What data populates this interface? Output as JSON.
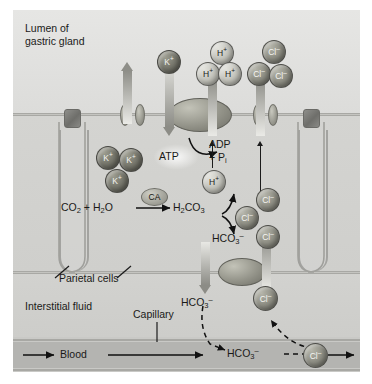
{
  "figure": {
    "background_color": "#d9d9d7"
  },
  "regions": {
    "lumen_label_line1": "Lumen of",
    "lumen_label_line2": "gastric gland",
    "parietal_label": "Parietal cells",
    "interstitial_label": "Interstitial fluid",
    "capillary_label": "Capillary",
    "blood_label": "Blood"
  },
  "reaction": {
    "enzyme": "CA",
    "substrates": "CO2 + H2O",
    "product": "H2CO3",
    "dissociation_products": [
      "H+",
      "HCO3-"
    ],
    "co2": "CO",
    "co2_sub": "2",
    "h2o_h": "H",
    "h2o_sub": "2",
    "h2o_o": "O",
    "plus": "+"
  },
  "energy": {
    "atp": "ATP",
    "adp": "ADP",
    "phosphate_line": "+ P",
    "phosphate_sub": "i"
  },
  "ions": {
    "potassium": "K",
    "potassium_charge": "+",
    "hydrogen": "H",
    "hydrogen_charge": "+",
    "chloride": "Cl",
    "chloride_charge": "–",
    "bicarbonate": "HCO",
    "bicarbonate_sub": "3",
    "bicarbonate_charge": "–",
    "carbonic_acid": "H",
    "carbonic_acid_sub2": "2",
    "carbonic_acid_co": "CO",
    "carbonic_acid_sub3": "3"
  },
  "lumen_ions": {
    "potassium_top": "K+",
    "hydrogen_group": [
      "H+",
      "H+",
      "H+"
    ],
    "chloride_group": [
      "Cl-",
      "Cl-",
      "Cl-"
    ]
  },
  "cytosol_ions": {
    "potassium_group": [
      "K+",
      "K+",
      "K+"
    ],
    "hydrogen": "H+",
    "chloride_group": [
      "Cl-",
      "Cl-",
      "Cl-"
    ]
  },
  "basolateral": {
    "bicarbonate_out": "HCO3-",
    "chloride_in": "Cl-"
  },
  "blood_stream": {
    "bicarbonate": "HCO3-",
    "chloride": "Cl-"
  },
  "colors": {
    "potassium_ion": "#6e6e64",
    "hydrogen_ion": "#bdbdb5",
    "chloride_ion": "#86867c",
    "membrane": "#9a9a96",
    "blood": "#b4b4b1",
    "cytosol": "#cfcfcc",
    "lumen": "#e0e0de"
  }
}
